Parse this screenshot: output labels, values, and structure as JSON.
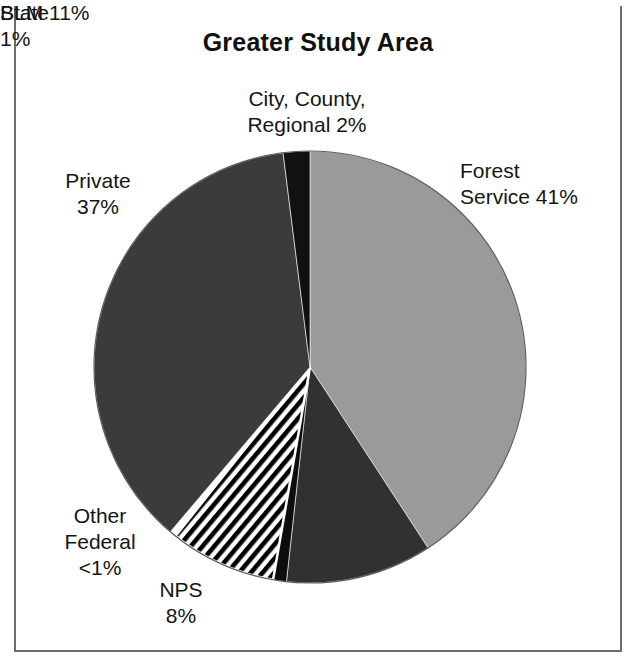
{
  "chart_data": {
    "type": "pie",
    "title": "Greater Study Area",
    "categories": [
      "Forest Service",
      "BLM",
      "State",
      "NPS",
      "Other Federal",
      "Private",
      "City, County, Regional"
    ],
    "values": [
      41,
      11,
      1,
      8,
      0.5,
      37,
      2
    ],
    "value_labels": [
      "41%",
      "11%",
      "1%",
      "8%",
      "<1%",
      "37%",
      "2%"
    ],
    "legend": "none",
    "grid": false,
    "start_angle_deg": 0,
    "direction": "clockwise",
    "slices": [
      {
        "name": "Forest Service",
        "label": "Forest\nService  41%",
        "percent": 41,
        "percent_text": "41%",
        "fill": "#9a9a9a",
        "pattern": "solid"
      },
      {
        "name": "BLM",
        "label": "BLM  11%",
        "percent": 11,
        "percent_text": "11%",
        "fill": "#313131",
        "pattern": "solid"
      },
      {
        "name": "State",
        "label": "State\n1%",
        "percent": 1,
        "percent_text": "1%",
        "fill": "#0d0d0d",
        "pattern": "solid"
      },
      {
        "name": "NPS",
        "label": "NPS\n8%",
        "percent": 8,
        "percent_text": "8%",
        "fill": "#ffffff",
        "pattern": "diagonal-hatch"
      },
      {
        "name": "Other Federal",
        "label": "Other\nFederal\n<1%",
        "percent": 0.5,
        "percent_text": "<1%",
        "fill": "#ffffff",
        "pattern": "solid"
      },
      {
        "name": "Private",
        "label": "Private\n37%",
        "percent": 37,
        "percent_text": "37%",
        "fill": "#3b3b3b",
        "pattern": "solid"
      },
      {
        "name": "City, County, Regional",
        "label": "City, County,\nRegional  2%",
        "percent": 2,
        "percent_text": "2%",
        "fill": "#111111",
        "pattern": "solid"
      }
    ]
  },
  "figure": {
    "title": "Greater Study Area",
    "labels": {
      "city_county_regional": "City, County,\nRegional  2%",
      "forest_service": "Forest\nService  41%",
      "private": "Private\n37%",
      "other_federal": "Other\nFederal\n<1%",
      "nps": "NPS\n8%",
      "state": "State\n1%",
      "blm": "BLM  11%"
    },
    "colors": {
      "forest_service": "#9a9a9a",
      "private": "#3b3b3b",
      "blm": "#313131",
      "state": "#0d0d0d",
      "city_county_regional": "#111111",
      "other_federal": "#ffffff",
      "nps_hatch_stroke": "#000000",
      "background": "#ffffff",
      "frame": "#6e6e6e",
      "text": "#151515"
    }
  }
}
